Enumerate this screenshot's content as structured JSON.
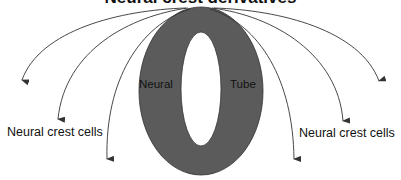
{
  "diagram": {
    "title": "Neural crest derivatives",
    "tube": {
      "left_label": "Neural",
      "right_label": "Tube",
      "fill_color": "#5b5b5b",
      "outline_color": "#333333"
    },
    "labels": {
      "left": "Neural crest cells",
      "right": "Neural crest cells"
    },
    "arrows": {
      "count": 6,
      "color": "#333333",
      "left_ends": [
        [
          22,
          85
        ],
        [
          58,
          124
        ],
        [
          107,
          164
        ]
      ],
      "right_ends": [
        [
          379,
          86
        ],
        [
          343,
          126
        ],
        [
          294,
          164
        ]
      ]
    }
  }
}
